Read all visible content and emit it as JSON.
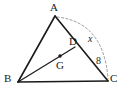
{
  "figure": {
    "kind": "geometry-diagram",
    "background_color": "#ffffff",
    "stroke_color": "#1a1a1a",
    "dashed_stroke_color": "#9a9a9a",
    "width": 124,
    "height": 95
  },
  "points": [
    {
      "id": "A",
      "label": "A",
      "x": 55,
      "y": 16,
      "label_x": 50,
      "label_y": 2,
      "marked": false
    },
    {
      "id": "B",
      "label": "B",
      "x": 18,
      "y": 82,
      "label_x": 5,
      "label_y": 73,
      "marked": false
    },
    {
      "id": "C",
      "label": "C",
      "x": 108,
      "y": 81,
      "label_x": 110,
      "label_y": 73,
      "marked": false
    },
    {
      "id": "D",
      "label": "D",
      "x": 74,
      "y": 47,
      "label_x": 70,
      "label_y": 35,
      "marked": false
    },
    {
      "id": "G",
      "label": "G",
      "x": 60,
      "y": 57,
      "label_x": 56,
      "label_y": 60,
      "marked": true
    }
  ],
  "segments": [
    {
      "id": "AB",
      "from": "A",
      "to": "B",
      "style": "solid"
    },
    {
      "id": "BC",
      "from": "B",
      "to": "C",
      "style": "solid"
    },
    {
      "id": "AC",
      "from": "A",
      "to": "C",
      "style": "solid"
    },
    {
      "id": "BD",
      "from": "B",
      "to": "D",
      "style": "solid"
    }
  ],
  "arcs": [
    {
      "id": "arc-AC",
      "from": "A",
      "to": "C",
      "style": "dashed",
      "path": "M 57 17 Q 104 22 108 79"
    }
  ],
  "measure_labels": [
    {
      "id": "label-x",
      "text": "x",
      "italic": true,
      "x": 89,
      "y": 34
    },
    {
      "id": "label-8",
      "text": "8",
      "italic": false,
      "x": 96,
      "y": 56
    }
  ]
}
